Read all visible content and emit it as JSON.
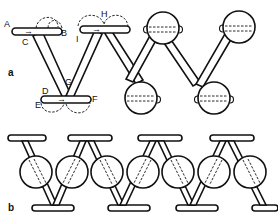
{
  "figure": {
    "panels": [
      {
        "id": "a",
        "label": "a"
      },
      {
        "id": "b",
        "label": "b"
      }
    ],
    "point_labels": [
      "A",
      "B",
      "C",
      "D",
      "E",
      "F",
      "G",
      "H",
      "I"
    ],
    "colors": {
      "stroke": "#111111",
      "background": "#ffffff"
    }
  }
}
